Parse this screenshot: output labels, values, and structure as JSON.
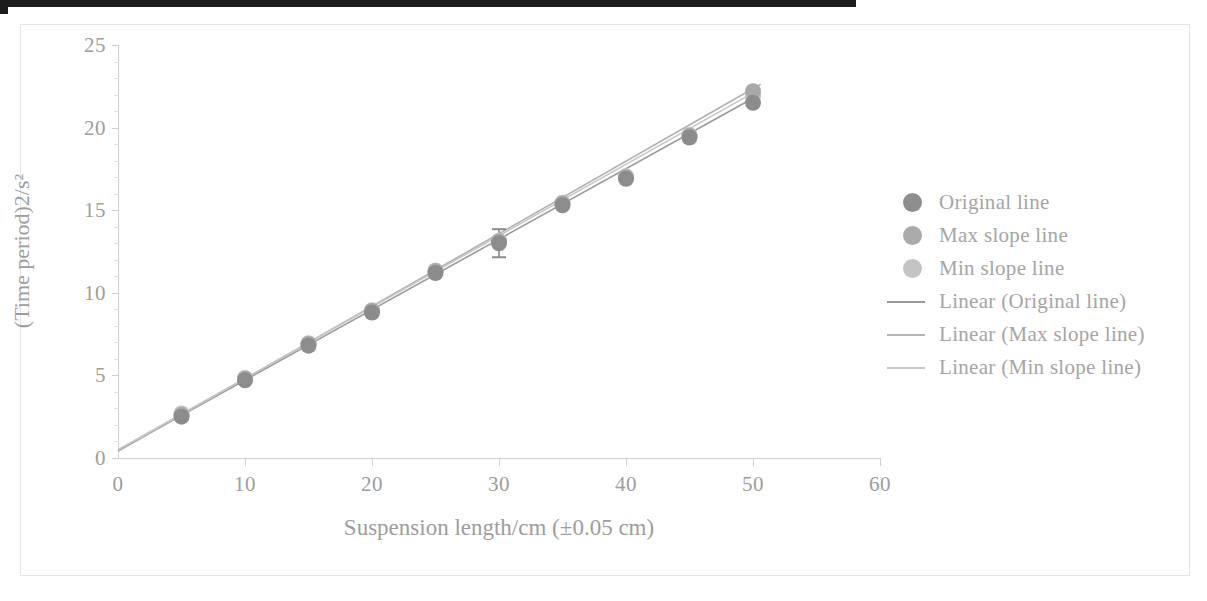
{
  "chart_data": {
    "type": "scatter",
    "title": "",
    "xlabel": "Suspension length/cm (±0.05 cm)",
    "ylabel": "(Time period)2/s²",
    "xlim": [
      0,
      60
    ],
    "ylim": [
      0,
      25
    ],
    "xticks": [
      "0",
      "10",
      "20",
      "30",
      "40",
      "50",
      "60"
    ],
    "yticks": [
      "0",
      "5",
      "10",
      "15",
      "20",
      "25"
    ],
    "xtick_step": 10,
    "ytick_step": 5,
    "grid": false,
    "legend_position": "right",
    "x": [
      5,
      10,
      15,
      20,
      25,
      30,
      35,
      40,
      45,
      50
    ],
    "series": [
      {
        "name": "Original line",
        "color": "#8c8c8c",
        "values": [
          2.5,
          4.7,
          6.8,
          8.8,
          11.2,
          13.0,
          15.3,
          16.9,
          19.4,
          21.5
        ]
      },
      {
        "name": "Max slope line",
        "color": "#a8a8a8",
        "values": [
          2.6,
          4.8,
          6.9,
          8.9,
          11.3,
          13.1,
          15.4,
          17.0,
          19.5,
          22.2
        ]
      },
      {
        "name": "Min slope line",
        "color": "#c2c2c2",
        "values": [
          2.7,
          4.85,
          6.95,
          8.95,
          11.35,
          13.15,
          15.45,
          17.05,
          19.55,
          21.9
        ]
      }
    ],
    "fits": [
      {
        "name": "Linear (Original line)",
        "color": "#9a9a9a",
        "intercept": 0.45,
        "slope": 0.4265,
        "x_start": 0,
        "x_end": 50.6
      },
      {
        "name": "Linear (Max slope line)",
        "color": "#b0b0b0",
        "intercept": 0.4,
        "slope": 0.4392,
        "x_start": 0,
        "x_end": 50.6
      },
      {
        "name": "Linear (Min slope line)",
        "color": "#c6c6c6",
        "intercept": 0.5,
        "slope": 0.432,
        "x_start": 0,
        "x_end": 50.6
      }
    ],
    "error_bars": [
      {
        "x": 30,
        "y": 13.0,
        "plus": 0.85,
        "minus": 0.85,
        "series": "Original line"
      }
    ],
    "annotations": []
  },
  "legend": {
    "items": [
      {
        "label": "Original line",
        "kind": "dot",
        "color": "#8e8e8e"
      },
      {
        "label": "Max slope line",
        "kind": "dot",
        "color": "#aaaaaa"
      },
      {
        "label": "Min slope line",
        "kind": "dot",
        "color": "#c4c4c4"
      },
      {
        "label": "Linear (Original line)",
        "kind": "line",
        "color": "#9a9a9a"
      },
      {
        "label": "Linear (Max slope line)",
        "kind": "line",
        "color": "#b4b4b4"
      },
      {
        "label": "Linear (Min slope line)",
        "kind": "line",
        "color": "#c8c8c8"
      }
    ]
  }
}
